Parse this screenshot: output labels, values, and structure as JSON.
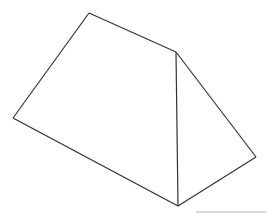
{
  "diagram": {
    "type": "triangular-prism",
    "stroke_color": "#333333",
    "background": "#ffffff",
    "vertices": {
      "top_left": [
        89,
        13
      ],
      "top_right": [
        176,
        52
      ],
      "left": [
        13,
        118
      ],
      "bottom": [
        178,
        206
      ],
      "right": [
        256,
        157
      ]
    },
    "edges": [
      [
        "top_left",
        "top_right"
      ],
      [
        "top_left",
        "left"
      ],
      [
        "left",
        "bottom"
      ],
      [
        "top_right",
        "bottom"
      ],
      [
        "top_right",
        "right"
      ],
      [
        "bottom",
        "right"
      ]
    ]
  }
}
